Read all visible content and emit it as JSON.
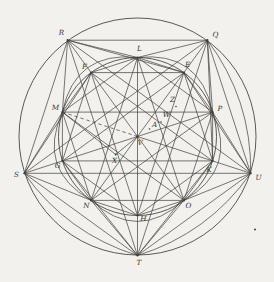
{
  "figure": {
    "background": "#f2f1ed",
    "stroke_color": "#3f3e3a",
    "label_color": "#35342f",
    "label_font_size": 7.2,
    "circles": [
      {
        "name": "outer-circle",
        "cx": 137.5,
        "cy": 136.5,
        "r": 118.5
      },
      {
        "name": "inner-circle",
        "cx": 137.5,
        "cy": 136.5,
        "r": 79
      }
    ],
    "points": [
      {
        "id": "R",
        "label": "R",
        "x": 67.6,
        "y": 40.2,
        "lx": 61.5,
        "ly": 34.5,
        "dot": 1.1
      },
      {
        "id": "Q",
        "label": "Q",
        "x": 207.4,
        "y": 40.2,
        "lx": 215.5,
        "ly": 37,
        "dot": 1.1
      },
      {
        "id": "U",
        "label": "U",
        "x": 250.7,
        "y": 173.3,
        "lx": 258.5,
        "ly": 180,
        "dot": 1.1
      },
      {
        "id": "T",
        "label": "T",
        "x": 137.5,
        "y": 255.5,
        "lx": 139,
        "ly": 264.5,
        "dot": 1.1
      },
      {
        "id": "S",
        "label": "S",
        "x": 24.3,
        "y": 173.3,
        "lx": 16.5,
        "ly": 177,
        "dot": 1.1
      },
      {
        "id": "L",
        "label": "L",
        "x": 137.5,
        "y": 57.5,
        "lx": 139.5,
        "ly": 51,
        "dot": 1.1
      },
      {
        "id": "E",
        "label": "E",
        "x": 183.9,
        "y": 72.6,
        "lx": 187.5,
        "ly": 66.5,
        "dot": 1.1
      },
      {
        "id": "P",
        "label": "P",
        "x": 212.6,
        "y": 112.1,
        "lx": 220,
        "ly": 110.5,
        "dot": 1.1
      },
      {
        "id": "K",
        "label": "K",
        "x": 212.6,
        "y": 160.9,
        "lx": 209,
        "ly": 171.5,
        "dot": 1.1
      },
      {
        "id": "O",
        "label": "O",
        "x": 183.9,
        "y": 200.4,
        "lx": 188.5,
        "ly": 207.5,
        "dot": 1.1
      },
      {
        "id": "H",
        "label": "H",
        "x": 137.5,
        "y": 215.5,
        "lx": 143.5,
        "ly": 221,
        "dot": 1.1
      },
      {
        "id": "N",
        "label": "N",
        "x": 91.1,
        "y": 200.4,
        "lx": 86.5,
        "ly": 208,
        "dot": 1.1
      },
      {
        "id": "G",
        "label": "G",
        "x": 62.4,
        "y": 160.9,
        "lx": 57.5,
        "ly": 168,
        "dot": 1.1
      },
      {
        "id": "M",
        "label": "M",
        "x": 62.4,
        "y": 112.1,
        "lx": 55.5,
        "ly": 109.5,
        "dot": 1.1
      },
      {
        "id": "F",
        "label": "F",
        "x": 91.1,
        "y": 72.6,
        "lx": 84.5,
        "ly": 68.5,
        "dot": 1.1
      },
      {
        "id": "V",
        "label": "V",
        "x": 137.5,
        "y": 136.5,
        "lx": 140,
        "ly": 145,
        "dot": 1.2
      },
      {
        "id": "X",
        "label": "X",
        "x": 115.7,
        "y": 154.5,
        "lx": 114.5,
        "ly": 162.5,
        "dot": 1.0
      },
      {
        "id": "A1",
        "label": "A′",
        "x": 149.5,
        "y": 129,
        "lx": 155.5,
        "ly": 126.5,
        "dot": 0.8
      },
      {
        "id": "W",
        "label": "W",
        "x": 161,
        "y": 122,
        "lx": 166.5,
        "ly": 117,
        "dot": 0.8
      },
      {
        "id": "Z",
        "label": "Z",
        "x": 176,
        "y": 106.5,
        "lx": 172.5,
        "ly": 101.5,
        "dot": 0.8
      }
    ],
    "segments": [
      [
        "R",
        "Q"
      ],
      [
        "Q",
        "U"
      ],
      [
        "U",
        "T"
      ],
      [
        "T",
        "S"
      ],
      [
        "S",
        "R"
      ],
      [
        "R",
        "U"
      ],
      [
        "R",
        "T"
      ],
      [
        "Q",
        "S"
      ],
      [
        "Q",
        "T"
      ],
      [
        "S",
        "U"
      ],
      [
        "F",
        "L"
      ],
      [
        "L",
        "E"
      ],
      [
        "E",
        "P"
      ],
      [
        "P",
        "K"
      ],
      [
        "K",
        "O"
      ],
      [
        "O",
        "H"
      ],
      [
        "H",
        "N"
      ],
      [
        "N",
        "G"
      ],
      [
        "G",
        "M"
      ],
      [
        "M",
        "F"
      ],
      [
        "M",
        "L"
      ],
      [
        "L",
        "P"
      ],
      [
        "P",
        "O"
      ],
      [
        "O",
        "N"
      ],
      [
        "N",
        "M"
      ],
      [
        "F",
        "E"
      ],
      [
        "E",
        "K"
      ],
      [
        "K",
        "H"
      ],
      [
        "H",
        "G"
      ],
      [
        "G",
        "F"
      ],
      [
        "L",
        "N"
      ],
      [
        "N",
        "P"
      ],
      [
        "P",
        "M"
      ],
      [
        "M",
        "O"
      ],
      [
        "O",
        "L"
      ],
      [
        "E",
        "G"
      ],
      [
        "G",
        "K"
      ],
      [
        "K",
        "F"
      ],
      [
        "F",
        "H"
      ],
      [
        "H",
        "E"
      ],
      [
        "L",
        "T"
      ],
      [
        "F",
        "O"
      ],
      [
        "E",
        "N"
      ],
      [
        "P",
        "G"
      ],
      [
        "V",
        "K"
      ],
      [
        "K",
        "U"
      ],
      [
        "R",
        "F"
      ],
      [
        "Q",
        "E"
      ],
      [
        "S",
        "G"
      ],
      [
        "R",
        "M"
      ],
      [
        "R",
        "L"
      ],
      [
        "Q",
        "L"
      ],
      [
        "Q",
        "P"
      ],
      [
        "U",
        "P"
      ],
      [
        "U",
        "O"
      ],
      [
        "T",
        "O"
      ],
      [
        "T",
        "N"
      ],
      [
        "S",
        "N"
      ],
      [
        "S",
        "M"
      ],
      [
        "R",
        "E"
      ],
      [
        "Q",
        "K"
      ],
      [
        "U",
        "E"
      ],
      [
        "T",
        "G"
      ],
      [
        "T",
        "K"
      ],
      [
        "S",
        "F"
      ],
      [
        "M",
        "X"
      ],
      [
        "X",
        "V"
      ]
    ],
    "dashed_segments": [
      [
        "M",
        "V"
      ]
    ],
    "arcs": [
      {
        "name": "arc-M-L",
        "from": "M",
        "to": "L",
        "cx": 75.2,
        "cy": 50.7
      },
      {
        "name": "arc-L-P",
        "from": "L",
        "to": "P",
        "cx": 199.8,
        "cy": 50.7
      },
      {
        "name": "arc-P-O",
        "from": "P",
        "to": "O",
        "cx": 238.3,
        "cy": 169.3
      },
      {
        "name": "arc-O-N",
        "from": "O",
        "to": "N",
        "cx": 137.5,
        "cy": 242.5
      },
      {
        "name": "arc-N-M",
        "from": "N",
        "to": "M",
        "cx": 36.7,
        "cy": 169.3
      },
      {
        "name": "arc-Q-U",
        "from": "Q",
        "to": "U",
        "cx": 251.6,
        "cy": 99.4
      },
      {
        "name": "arc-T-U",
        "from": "T",
        "to": "U",
        "cx": 208.0,
        "cy": 233.6
      },
      {
        "name": "arc-S-T",
        "from": "S",
        "to": "T",
        "cx": 67.0,
        "cy": 233.6
      }
    ],
    "stray_marks": [
      {
        "name": "stray-mark",
        "x": 255,
        "y": 229.5,
        "r": 1
      }
    ]
  }
}
